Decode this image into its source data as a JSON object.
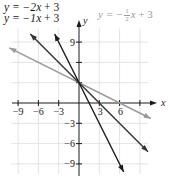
{
  "chart_data": {
    "type": "line",
    "title": "",
    "xlabel": "x",
    "ylabel": "y",
    "xlim": [
      -10,
      11
    ],
    "ylim": [
      -10.5,
      12
    ],
    "x_ticks": [
      -9,
      -6,
      -3,
      3,
      6,
      9
    ],
    "x_tick_labels": [
      "−9",
      "−6",
      "−3",
      "3",
      "6"
    ],
    "y_ticks": [
      9,
      6,
      3,
      -3,
      -6,
      -9
    ],
    "y_tick_labels": [
      "9",
      "−3",
      "−6",
      "−9"
    ],
    "grid": true,
    "grid_step": 3,
    "series": [
      {
        "name": "y = −2x + 3",
        "slope": -2,
        "intercept": 3,
        "color": "#1a1a1a",
        "x_range": [
          -3.6,
          6.6
        ]
      },
      {
        "name": "y = −1x + 3",
        "slope": -1,
        "intercept": 3,
        "color": "#333333",
        "x_range": [
          -7.2,
          10.2
        ]
      },
      {
        "name": "y = −½x + 3",
        "slope": -0.5,
        "intercept": 3,
        "color": "#9a9a9a",
        "x_range": [
          -10.3,
          10.6
        ]
      }
    ],
    "legend": {
      "position": "top",
      "entries": [
        {
          "text_prefix": "y = −2",
          "var": "x",
          "text_suffix": " + 3"
        },
        {
          "text_prefix": "y = −1",
          "var": "x",
          "text_suffix": " + 3"
        },
        {
          "text_prefix": "y = −",
          "frac_num": "1",
          "frac_den": "2",
          "var": "x",
          "text_suffix": " + 3"
        }
      ]
    }
  },
  "labels": {
    "eq1_prefix": "y = −2",
    "eq1_var": "x",
    "eq1_suffix": " + 3",
    "eq2_prefix": "y = −1",
    "eq2_var": "x",
    "eq2_suffix": " + 3",
    "eq3_prefix": "y = −",
    "eq3_num": "1",
    "eq3_den": "2",
    "eq3_var": "x",
    "eq3_suffix": " + 3",
    "x_axis": "x",
    "y_axis": "y"
  },
  "colors": {
    "grid": "#dcdcdc",
    "axis": "#1a1a1a",
    "line_dark": "#1a1a1a",
    "line_mid": "#333333",
    "line_gray": "#9a9a9a",
    "tick_text": "#1a1a1a"
  }
}
